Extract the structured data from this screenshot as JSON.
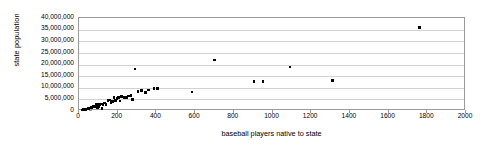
{
  "chart_data": {
    "type": "scatter",
    "title": "",
    "xlabel": "baseball players native to state",
    "ylabel": "state population",
    "xlim": [
      0,
      2000
    ],
    "ylim": [
      0,
      40000000
    ],
    "grid": true,
    "legend": false,
    "xticks": [
      0,
      200,
      400,
      600,
      800,
      1000,
      1200,
      1400,
      1600,
      1800,
      2000
    ],
    "xtick_labels": [
      "0",
      "200",
      "400",
      "600",
      "800",
      "1000",
      "1200",
      "1400",
      "1600",
      "1800",
      "2000"
    ],
    "yticks": [
      0,
      5000000,
      10000000,
      15000000,
      20000000,
      25000000,
      30000000,
      35000000,
      40000000
    ],
    "ytick_labels": [
      "0",
      "5,000,000",
      "10,000,000",
      "15,000,000",
      "20,000,000",
      "25,000,000",
      "30,000,000",
      "35,000,000",
      "40,000,000"
    ],
    "marker": "square",
    "marker_color": "#000000",
    "points": [
      [
        15,
        500000
      ],
      [
        20,
        560000
      ],
      [
        25,
        640000
      ],
      [
        30,
        700000
      ],
      [
        35,
        750000
      ],
      [
        40,
        810000
      ],
      [
        45,
        900000
      ],
      [
        50,
        1050000
      ],
      [
        55,
        1250000
      ],
      [
        58,
        1320000
      ],
      [
        62,
        1400000
      ],
      [
        66,
        1580000
      ],
      [
        70,
        1680000
      ],
      [
        74,
        1820000
      ],
      [
        78,
        1900000
      ],
      [
        82,
        2000000
      ],
      [
        86,
        2100000
      ],
      [
        90,
        2700000
      ],
      [
        95,
        1300000
      ],
      [
        100,
        1850000
      ],
      [
        105,
        2900000
      ],
      [
        110,
        3050000
      ],
      [
        118,
        1180000
      ],
      [
        125,
        2850000
      ],
      [
        133,
        3500000
      ],
      [
        140,
        2750000
      ],
      [
        150,
        4450000
      ],
      [
        158,
        4650000
      ],
      [
        165,
        3600000
      ],
      [
        172,
        4050000
      ],
      [
        180,
        5700000
      ],
      [
        188,
        4550000
      ],
      [
        196,
        5300000
      ],
      [
        205,
        5700000
      ],
      [
        212,
        4300000
      ],
      [
        220,
        6350000
      ],
      [
        232,
        5900000
      ],
      [
        245,
        5700000
      ],
      [
        255,
        6450000
      ],
      [
        268,
        6550000
      ],
      [
        278,
        4950000
      ],
      [
        290,
        18000000
      ],
      [
        305,
        8400000
      ],
      [
        322,
        8800000
      ],
      [
        345,
        8000000
      ],
      [
        360,
        9000000
      ],
      [
        388,
        9700000
      ],
      [
        405,
        9800000
      ],
      [
        585,
        8200000
      ],
      [
        700,
        22000000
      ],
      [
        905,
        12600000
      ],
      [
        950,
        12800000
      ],
      [
        1090,
        19000000
      ],
      [
        1310,
        13000000
      ],
      [
        1760,
        36000000
      ]
    ]
  }
}
